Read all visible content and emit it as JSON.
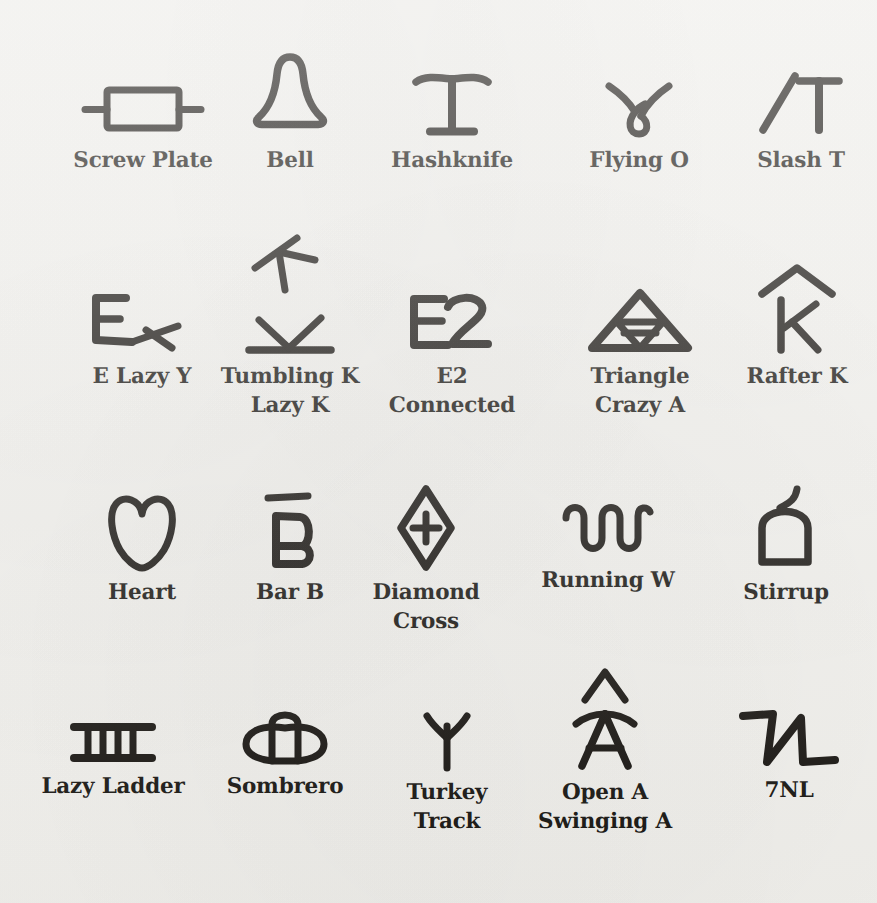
{
  "page": {
    "background_color": "#f2f1ed",
    "ink_color": "#14110d",
    "columns": 5,
    "rows": 4,
    "total_brands": 20
  },
  "brands": [
    {
      "id": "screw-plate",
      "label": "Screw Plate",
      "icon": "screw-plate-brand-icon",
      "row": 1,
      "col": 1,
      "cx": 143,
      "label_y": 146
    },
    {
      "id": "bell",
      "label": "Bell",
      "icon": "bell-brand-icon",
      "row": 1,
      "col": 2,
      "cx": 290,
      "label_y": 146
    },
    {
      "id": "hashknife",
      "label": "Hashknife",
      "icon": "hashknife-brand-icon",
      "row": 1,
      "col": 3,
      "cx": 452,
      "label_y": 146
    },
    {
      "id": "flying-o",
      "label": "Flying O",
      "icon": "flying-o-brand-icon",
      "row": 1,
      "col": 4,
      "cx": 639,
      "label_y": 146
    },
    {
      "id": "slash-t",
      "label": "Slash T",
      "icon": "slash-t-brand-icon",
      "row": 1,
      "col": 5,
      "cx": 799,
      "label_y": 146
    },
    {
      "id": "e-lazy-y",
      "label": "E Lazy Y",
      "icon": "e-lazy-y-brand-icon",
      "row": 2,
      "col": 1,
      "cx": 142,
      "label_y": 385
    },
    {
      "id": "tumbling-k-lazy-k",
      "label": "Tumbling K\nLazy K",
      "icon": "tumbling-k-lazy-k-brand-icon",
      "row": 2,
      "col": 2,
      "cx": 290,
      "label_y": 385
    },
    {
      "id": "e2-connected",
      "label": "E2\nConnected",
      "icon": "e2-connected-brand-icon",
      "row": 2,
      "col": 3,
      "cx": 452,
      "label_y": 385
    },
    {
      "id": "triangle-crazy-a",
      "label": "Triangle\nCrazy A",
      "icon": "triangle-crazy-a-brand-icon",
      "row": 2,
      "col": 4,
      "cx": 639,
      "label_y": 385
    },
    {
      "id": "rafter-k",
      "label": "Rafter K",
      "icon": "rafter-k-brand-icon",
      "row": 2,
      "col": 5,
      "cx": 797,
      "label_y": 385
    },
    {
      "id": "heart",
      "label": "Heart",
      "icon": "heart-brand-icon",
      "row": 3,
      "col": 1,
      "cx": 142,
      "label_y": 587
    },
    {
      "id": "bar-b",
      "label": "Bar B",
      "icon": "bar-b-brand-icon",
      "row": 3,
      "col": 2,
      "cx": 290,
      "label_y": 587
    },
    {
      "id": "diamond-cross",
      "label": "Diamond\nCross",
      "icon": "diamond-cross-brand-icon",
      "row": 3,
      "col": 3,
      "cx": 426,
      "label_y": 587
    },
    {
      "id": "running-w",
      "label": "Running W",
      "icon": "running-w-brand-icon",
      "row": 3,
      "col": 4,
      "cx": 608,
      "label_y": 587
    },
    {
      "id": "stirrup",
      "label": "Stirrup",
      "icon": "stirrup-brand-icon",
      "row": 3,
      "col": 5,
      "cx": 786,
      "label_y": 587
    },
    {
      "id": "lazy-ladder",
      "label": "Lazy Ladder",
      "icon": "lazy-ladder-brand-icon",
      "row": 4,
      "col": 1,
      "cx": 113,
      "label_y": 795
    },
    {
      "id": "sombrero",
      "label": "Sombrero",
      "icon": "sombrero-brand-icon",
      "row": 4,
      "col": 2,
      "cx": 285,
      "label_y": 795
    },
    {
      "id": "turkey-track",
      "label": "Turkey\nTrack",
      "icon": "turkey-track-brand-icon",
      "row": 4,
      "col": 3,
      "cx": 447,
      "label_y": 795
    },
    {
      "id": "open-a-swinging-a",
      "label": "Open A\nSwinging A",
      "icon": "open-a-swinging-a-brand-icon",
      "row": 4,
      "col": 4,
      "cx": 605,
      "label_y": 795
    },
    {
      "id": "seven-n-l",
      "label": "7NL",
      "icon": "seven-n-l-brand-icon",
      "row": 4,
      "col": 5,
      "cx": 789,
      "label_y": 795
    }
  ]
}
